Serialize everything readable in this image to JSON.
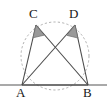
{
  "figure": {
    "kind": "geometry-diagram",
    "width": 107,
    "height": 108,
    "background": "#ffffff"
  },
  "labels": {
    "A": "A",
    "B": "B",
    "C": "C",
    "D": "D"
  },
  "colors": {
    "stroke": "#4a4a4a",
    "circle_dash": "#b0b0b0",
    "baseline": "#555555",
    "angle_fill": "#9a9a9a",
    "angle_stroke": "#6e6e6e",
    "label_text": "#161616"
  },
  "geometry": {
    "circle": {
      "cx": 55,
      "cy": 56,
      "r": 34,
      "dashed": true
    },
    "points": {
      "A": {
        "x": 22,
        "y": 85
      },
      "B": {
        "x": 88,
        "y": 85
      },
      "C": {
        "x": 36,
        "y": 25
      },
      "D": {
        "x": 75,
        "y": 25
      }
    },
    "baseline": {
      "x1": 0,
      "y1": 85,
      "x2": 107,
      "y2": 85
    },
    "segments": [
      {
        "name": "AC",
        "from": "A",
        "to": "C"
      },
      {
        "name": "AD",
        "from": "A",
        "to": "D"
      },
      {
        "name": "BC",
        "from": "B",
        "to": "C"
      },
      {
        "name": "BD",
        "from": "B",
        "to": "D"
      },
      {
        "name": "AB",
        "from": "A",
        "to": "B"
      }
    ],
    "intersection": {
      "x": 55,
      "y": 52
    },
    "angle_markers": [
      {
        "at": "C",
        "filled": true
      },
      {
        "at": "D",
        "filled": true
      }
    ]
  }
}
